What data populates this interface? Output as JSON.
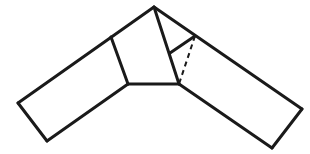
{
  "diagram": {
    "type": "geometry-folded-strip",
    "stroke_color": "#1a1a1a",
    "background": "#ffffff",
    "stroke_width": 3,
    "points": {
      "apex": [
        154,
        7
      ],
      "left_top_joint": [
        111,
        37
      ],
      "left_bottom_joint": [
        128,
        84
      ],
      "right_bottom_joint": [
        179,
        84
      ],
      "right_edge_point": [
        195,
        36
      ],
      "inner_fold_point": [
        170,
        53
      ],
      "left_far_top": [
        18,
        103
      ],
      "left_far_bottom": [
        47,
        141
      ],
      "right_far_top": [
        302,
        109
      ],
      "right_far_bottom": [
        272,
        148
      ]
    },
    "solid_segments": [
      [
        [
          18,
          103
        ],
        [
          154,
          7
        ]
      ],
      [
        [
          154,
          7
        ],
        [
          302,
          109
        ]
      ],
      [
        [
          302,
          109
        ],
        [
          272,
          148
        ]
      ],
      [
        [
          272,
          148
        ],
        [
          179,
          84
        ]
      ],
      [
        [
          179,
          84
        ],
        [
          128,
          84
        ]
      ],
      [
        [
          128,
          84
        ],
        [
          47,
          141
        ]
      ],
      [
        [
          47,
          141
        ],
        [
          18,
          103
        ]
      ],
      [
        [
          111,
          37
        ],
        [
          128,
          84
        ]
      ],
      [
        [
          154,
          7
        ],
        [
          179,
          84
        ]
      ],
      [
        [
          170,
          53
        ],
        [
          195,
          36
        ]
      ]
    ],
    "dashed_segments": [
      [
        [
          195,
          36
        ],
        [
          179,
          84
        ]
      ]
    ]
  }
}
